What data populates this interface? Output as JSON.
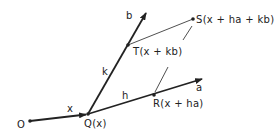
{
  "diagram": {
    "points": {
      "O": {
        "label": "O",
        "x": 30,
        "y": 121
      },
      "Q": {
        "label": "Q(x)",
        "x": 88,
        "y": 114
      },
      "R": {
        "label": "R(x + ha)",
        "x": 154,
        "y": 95
      },
      "T": {
        "label": "T(x + kb)",
        "x": 128,
        "y": 45
      },
      "S": {
        "label": "S(x + ha + kb)",
        "x": 193,
        "y": 19
      }
    },
    "vectors": {
      "x": {
        "label": "x"
      },
      "a": {
        "label": "a"
      },
      "b": {
        "label": "b"
      },
      "h": {
        "label": "h"
      },
      "k": {
        "label": "k"
      }
    },
    "colors": {
      "stroke": "#222222",
      "background": "#ffffff"
    }
  }
}
